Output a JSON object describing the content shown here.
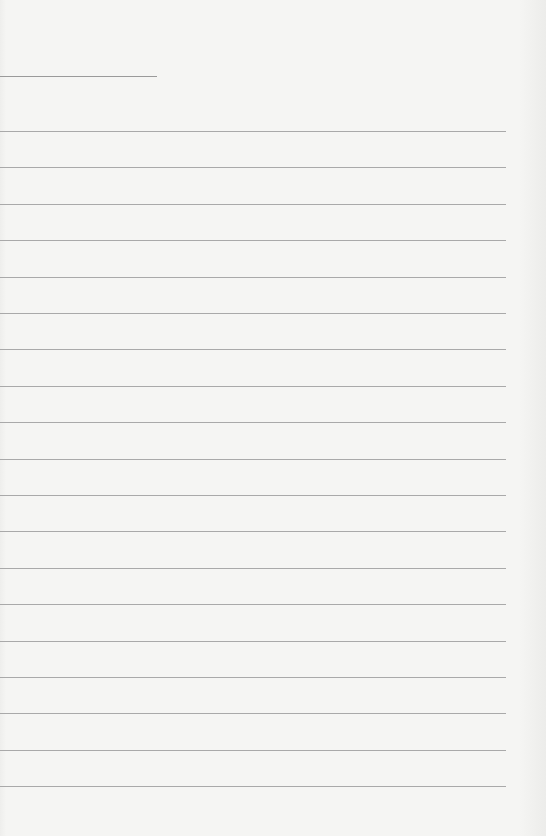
{
  "page": {
    "type": "lined-paper",
    "background_color": "#f3f3f1",
    "line_color": "#a9a9a9",
    "title_line": {
      "top": 76,
      "width": 157
    },
    "rules": {
      "count": 19,
      "first_top": 131,
      "spacing": 36.4,
      "width": 506
    }
  }
}
